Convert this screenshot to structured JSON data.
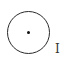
{
  "radio": {
    "state": "selected"
  },
  "cursor": {
    "glyph": "I",
    "icon": "text-cursor-icon"
  }
}
